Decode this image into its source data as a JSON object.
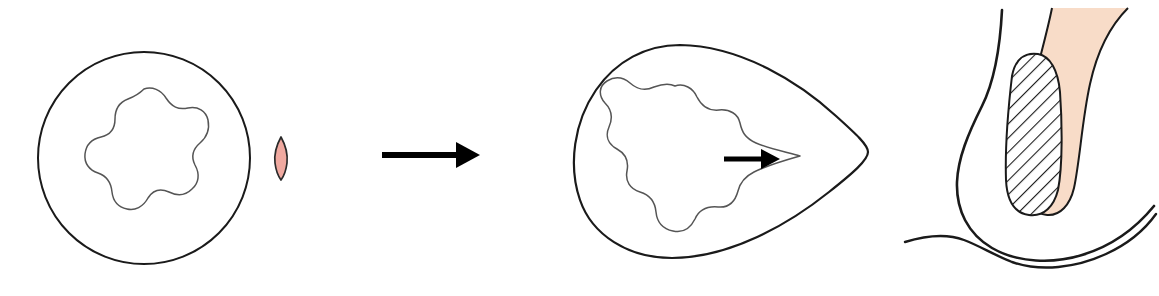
{
  "figure": {
    "title": "Duct deformation and sperm-like particle insertion schematic",
    "width": 1159,
    "height": 296,
    "background_color": "#ffffff",
    "stroke_color": "#1a1a1a",
    "inner_stroke_color": "#555555",
    "arrow_color": "#000000",
    "pink_fill": "#f0a9a0",
    "peach_fill": "#f8dcc8",
    "hatch_color": "#1a1a1a"
  },
  "panels": [
    {
      "id": "panel-before",
      "name": "undeformed-duct",
      "label": "",
      "shapes": [
        {
          "name": "outer-circle",
          "type": "circle",
          "cx": 144,
          "cy": 158,
          "r": 106,
          "fill": "none",
          "stroke": "#1a1a1a",
          "stroke_width": 2
        },
        {
          "name": "inner-wavy-lumen",
          "type": "wavy-closed-curve",
          "cx": 144,
          "cy": 159,
          "base_radius": 63,
          "amplitude": 10,
          "lobes": 7,
          "phase_deg": 95,
          "fill": "none",
          "stroke": "#555555",
          "stroke_width": 1.4
        }
      ]
    },
    {
      "id": "panel-particle",
      "name": "pink-spindle-particle",
      "label": "",
      "shapes": [
        {
          "name": "spindle-particle",
          "type": "lens",
          "cx": 281,
          "cy": 158,
          "half_width": 6,
          "half_height": 21,
          "fill": "#f0a9a0",
          "stroke": "#2a2a2a",
          "stroke_width": 1.6
        }
      ]
    },
    {
      "id": "panel-transition",
      "name": "transition-arrow",
      "label": "",
      "shapes": [
        {
          "name": "transformation-arrow",
          "type": "arrow",
          "x1": 382,
          "y1": 155,
          "x2": 478,
          "y2": 155,
          "stroke_width": 6,
          "head_length": 22,
          "head_half_width": 13,
          "color": "#000000"
        }
      ]
    },
    {
      "id": "panel-after",
      "name": "deformed-duct",
      "label": "",
      "shapes": [
        {
          "name": "outer-teardrop",
          "type": "teardrop",
          "fill": "none",
          "stroke": "#1a1a1a",
          "stroke_width": 2,
          "apex_x": 866,
          "apex_y": 152,
          "left_x": 578,
          "top_y": 45,
          "bottom_y": 258
        },
        {
          "name": "inner-wavy-lumen-pointed",
          "type": "wavy-closed-curve-with-point",
          "cx": 688,
          "cy": 158,
          "base_radius": 62,
          "amplitude": 9,
          "lobes": 7,
          "point_x": 800,
          "point_y": 156,
          "fill": "none",
          "stroke": "#555555",
          "stroke_width": 1.4
        },
        {
          "name": "lumen-indicator-arrow",
          "type": "arrow",
          "x1": 724,
          "y1": 159,
          "x2": 775,
          "y2": 159,
          "stroke_width": 4.5,
          "head_length": 15,
          "head_half_width": 9,
          "color": "#000000"
        }
      ]
    },
    {
      "id": "panel-anatomy",
      "name": "anatomical-cross-section",
      "label": "",
      "shapes": [
        {
          "name": "body-outline-left",
          "type": "curve",
          "stroke": "#1a1a1a",
          "stroke_width": 2.6
        },
        {
          "name": "body-outline-bottom",
          "type": "curve",
          "stroke": "#1a1a1a",
          "stroke_width": 2.6
        },
        {
          "name": "skin-fold-line",
          "type": "curve",
          "stroke": "#1a1a1a",
          "stroke_width": 2.2
        },
        {
          "name": "hatched-duct-region",
          "type": "hatched-region",
          "fill": "#ffffff",
          "hatch_color": "#1a1a1a",
          "hatch_angle_deg": 45,
          "hatch_spacing": 7,
          "stroke": "#1a1a1a",
          "stroke_width": 2
        },
        {
          "name": "peach-tissue-band",
          "type": "band",
          "fill": "#f8dcc8",
          "stroke": "#1a1a1a",
          "stroke_width": 2
        }
      ]
    }
  ],
  "legend": {
    "items": []
  }
}
